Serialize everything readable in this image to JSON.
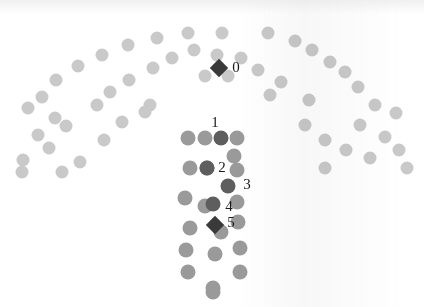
{
  "figure": {
    "title": "",
    "background_color": "#ffffff",
    "width": 424,
    "height": 307
  },
  "palette": {
    "arc_dot": "#c9c9c9",
    "arc_dot_light": "#d4d4d4",
    "column_dot": "#9a9a9a",
    "column_dot_dark": "#6f6f6f",
    "highlight_dot": "#5e5e5e",
    "marker_diamond": "#3a3a3a",
    "label_text": "#1a1a1a"
  },
  "chart_data": {
    "type": "scatter",
    "title": "",
    "xlabel": "",
    "ylabel": "",
    "xlim": [
      0,
      424
    ],
    "ylim": [
      0,
      307
    ],
    "grid": false,
    "legend": "none",
    "annotations": [
      {
        "text": "0",
        "x": 236,
        "y": 67,
        "font_size": 15
      },
      {
        "text": "1",
        "x": 215,
        "y": 122,
        "font_size": 15
      },
      {
        "text": "2",
        "x": 222,
        "y": 167,
        "font_size": 15
      },
      {
        "text": "3",
        "x": 247,
        "y": 184,
        "font_size": 15
      },
      {
        "text": "4",
        "x": 229,
        "y": 206,
        "font_size": 15
      },
      {
        "text": "5",
        "x": 231,
        "y": 222,
        "font_size": 15
      }
    ],
    "series": [
      {
        "name": "arc-dots",
        "marker": "circle",
        "color": "#c9c9c9",
        "size": 13,
        "points": [
          [
            188,
            33
          ],
          [
            222,
            33
          ],
          [
            157,
            38
          ],
          [
            268,
            33
          ],
          [
            128,
            45
          ],
          [
            295,
            41
          ],
          [
            194,
            50
          ],
          [
            217,
            55
          ],
          [
            102,
            55
          ],
          [
            312,
            50
          ],
          [
            172,
            58
          ],
          [
            241,
            58
          ],
          [
            78,
            66
          ],
          [
            330,
            62
          ],
          [
            153,
            68
          ],
          [
            258,
            70
          ],
          [
            205,
            76
          ],
          [
            228,
            76
          ],
          [
            56,
            80
          ],
          [
            345,
            72
          ],
          [
            129,
            80
          ],
          [
            281,
            82
          ],
          [
            42,
            97
          ],
          [
            358,
            87
          ],
          [
            110,
            92
          ],
          [
            270,
            95
          ],
          [
            97,
            105
          ],
          [
            309,
            100
          ],
          [
            28,
            108
          ],
          [
            375,
            105
          ],
          [
            150,
            105
          ],
          [
            145,
            112
          ],
          [
            55,
            118
          ],
          [
            396,
            113
          ],
          [
            122,
            122
          ],
          [
            305,
            125
          ],
          [
            66,
            126
          ],
          [
            360,
            125
          ],
          [
            38,
            135
          ],
          [
            385,
            137
          ],
          [
            104,
            140
          ],
          [
            325,
            140
          ],
          [
            49,
            148
          ],
          [
            346,
            150
          ],
          [
            23,
            160
          ],
          [
            399,
            150
          ],
          [
            80,
            162
          ],
          [
            370,
            158
          ],
          [
            22,
            172
          ],
          [
            407,
            168
          ],
          [
            62,
            172
          ],
          [
            325,
            168
          ]
        ]
      },
      {
        "name": "column-dots",
        "marker": "circle",
        "color": "#9a9a9a",
        "size": 15,
        "points": [
          [
            188,
            138
          ],
          [
            205,
            138
          ],
          [
            237,
            138
          ],
          [
            234,
            156
          ],
          [
            190,
            168
          ],
          [
            207,
            168
          ],
          [
            237,
            170
          ],
          [
            185,
            198
          ],
          [
            237,
            202
          ],
          [
            205,
            206
          ],
          [
            238,
            222
          ],
          [
            190,
            228
          ],
          [
            221,
            232
          ],
          [
            186,
            250
          ],
          [
            240,
            248
          ],
          [
            215,
            254
          ],
          [
            188,
            272
          ],
          [
            240,
            272
          ],
          [
            213,
            288
          ],
          [
            213,
            292
          ]
        ]
      },
      {
        "name": "highlighted-dots",
        "marker": "circle",
        "color": "#5e5e5e",
        "size": 15,
        "labels": [
          "1",
          "2",
          "3",
          "4"
        ],
        "points": [
          [
            221,
            138
          ],
          [
            207,
            168
          ],
          [
            228,
            186
          ],
          [
            213,
            204
          ]
        ]
      },
      {
        "name": "marker-diamonds",
        "marker": "diamond",
        "color": "#3a3a3a",
        "size": 13,
        "labels": [
          "0",
          "5"
        ],
        "points": [
          [
            219,
            68
          ],
          [
            215,
            225
          ]
        ]
      }
    ]
  }
}
